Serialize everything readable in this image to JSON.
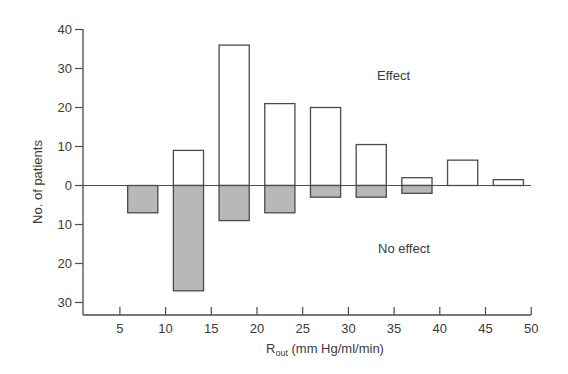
{
  "chart_data": {
    "type": "bar",
    "title": "",
    "xlabel": "R_out (mm Hg/ml/min)",
    "xlabel_main": "R",
    "xlabel_sub": "out",
    "xlabel_unit": "(mm Hg/ml/min)",
    "ylabel": "No. of patients",
    "x_ticks": [
      5,
      10,
      15,
      20,
      25,
      30,
      35,
      40,
      45,
      50
    ],
    "y_ticks_up": [
      0,
      10,
      20,
      30,
      40
    ],
    "y_ticks_down": [
      10,
      20,
      30
    ],
    "xlim": [
      2,
      50
    ],
    "ylim": [
      -33,
      40
    ],
    "categories": [
      "5-10",
      "10-15",
      "15-20",
      "20-25",
      "25-30",
      "30-35",
      "35-40",
      "40-45",
      "45-50"
    ],
    "bin_centers": [
      7.5,
      12.5,
      17.5,
      22.5,
      27.5,
      32.5,
      37.5,
      42.5,
      47.5
    ],
    "series": [
      {
        "name": "Effect",
        "direction": "up",
        "fill": "#ffffff",
        "values": [
          0,
          9,
          36,
          21,
          20,
          10.5,
          2,
          6.5,
          1.5
        ]
      },
      {
        "name": "No effect",
        "direction": "down",
        "fill": "#b8b8b8",
        "values": [
          7,
          27,
          9,
          7,
          3,
          3,
          2,
          0,
          0
        ]
      }
    ],
    "annotations": [
      {
        "text": "Effect",
        "x": 40,
        "y": 22
      },
      {
        "text": "No effect",
        "x": 40,
        "y": -16
      }
    ],
    "grid": false,
    "legend": "none"
  }
}
